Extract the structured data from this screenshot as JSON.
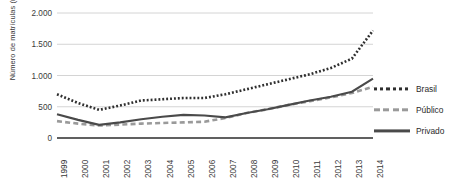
{
  "chart_data": {
    "type": "line",
    "title": "",
    "xlabel": "",
    "ylabel": "Número de matrículas (mil)",
    "categories": [
      "1999",
      "2000",
      "2001",
      "2002",
      "2003",
      "2004",
      "2005",
      "2006",
      "2007",
      "2008",
      "2009",
      "2010",
      "2011",
      "2012",
      "2013",
      "2014"
    ],
    "ylim": [
      0,
      2000
    ],
    "yticks": [
      "0",
      "500",
      "1.000",
      "1.500",
      "2.000"
    ],
    "ytick_values": [
      0,
      500,
      1000,
      1500,
      2000
    ],
    "grid": true,
    "legend_position": "right",
    "series": [
      {
        "name": "Brasil",
        "style": "dotted",
        "color": "#2f2f2f",
        "values": [
          700,
          560,
          450,
          520,
          600,
          620,
          640,
          640,
          700,
          780,
          860,
          940,
          1020,
          1120,
          1270,
          1720
        ]
      },
      {
        "name": "Público",
        "style": "dashed",
        "color": "#9a9a9a",
        "values": [
          270,
          230,
          200,
          215,
          230,
          240,
          250,
          260,
          320,
          400,
          460,
          530,
          590,
          650,
          720,
          820
        ]
      },
      {
        "name": "Privado",
        "style": "solid",
        "color": "#4a4a4a",
        "values": [
          380,
          290,
          210,
          250,
          300,
          340,
          370,
          360,
          330,
          400,
          460,
          530,
          600,
          660,
          740,
          950
        ]
      }
    ]
  },
  "legend": {
    "items": [
      {
        "label": "Brasil"
      },
      {
        "label": "Público"
      },
      {
        "label": "Privado"
      }
    ]
  },
  "axis": {
    "y_title": "Número de matrículas (mil)"
  }
}
